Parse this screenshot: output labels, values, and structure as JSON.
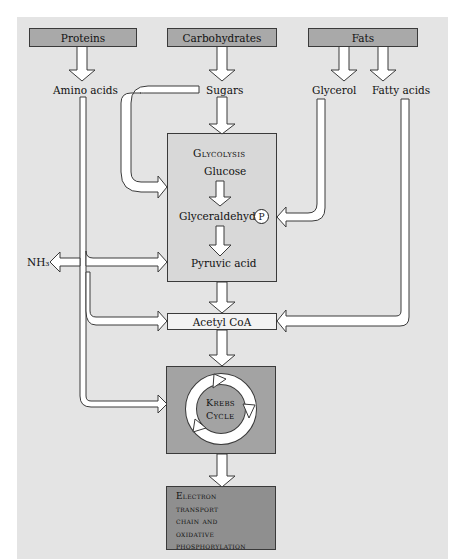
{
  "sources": {
    "proteins": "Proteins",
    "carbohydrates": "Carbohydrates",
    "fats": "Fats"
  },
  "intermediates": {
    "amino_acids": "Amino acids",
    "sugars": "Sugars",
    "glycerol": "Glycerol",
    "fatty_acids": "Fatty acids",
    "nh3": "NH₃"
  },
  "glycolysis": {
    "title": "Glycolysis",
    "glucose": "Glucose",
    "glyceraldehyde": "Glyceraldehyde",
    "phosphate_symbol": "P",
    "pyruvic_acid": "Pyruvic acid"
  },
  "acetyl_coa": "Acetyl CoA",
  "krebs": {
    "line1": "Krebs",
    "line2": "Cycle"
  },
  "etc": {
    "line1": "Electron",
    "line2": "transport",
    "line3": "chain and",
    "line4": "oxidative",
    "line5": "phosphorylation"
  },
  "colors": {
    "background": "#e4e4e4",
    "source_box": "#a9a9a9",
    "glycolysis_box": "#d8d8d8",
    "krebs_box": "#a3a3a3",
    "etc_box": "#8f8f8f",
    "arrow_fill": "#ffffff",
    "outline": "#3a3a3a"
  }
}
